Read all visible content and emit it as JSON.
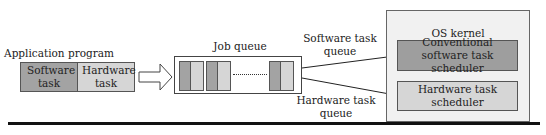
{
  "app_program": {
    "title": "Application program",
    "software_task": "Software task",
    "hardware_task": "Hardware task"
  },
  "job_queue": {
    "title": "Job queue",
    "ellipsis": "......"
  },
  "queues": {
    "software": "Software task queue",
    "hardware": "Hardware task queue"
  },
  "os_kernel": {
    "title": "OS kernel",
    "sw_scheduler": "Conventional software task scheduler",
    "hw_scheduler": "Hardware task scheduler"
  },
  "colors": {
    "software": "#a3a3a3",
    "hardware": "#d6d6d6",
    "kernel_bg": "#f1f1f1"
  }
}
